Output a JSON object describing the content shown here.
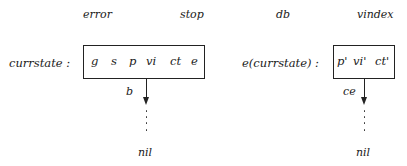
{
  "top_labels": [
    "error",
    "stop",
    "db",
    "vindex"
  ],
  "left": {
    "row_label": "currstate :",
    "cells": [
      "g",
      "s",
      "p",
      "vi",
      "ct",
      "e"
    ],
    "arrow_label": "b",
    "terminal": "nil"
  },
  "right": {
    "row_label": "e(currstate) :",
    "cells": [
      "p'",
      "vi'",
      "ct'"
    ],
    "arrow_label": "ce",
    "terminal": "nil"
  }
}
